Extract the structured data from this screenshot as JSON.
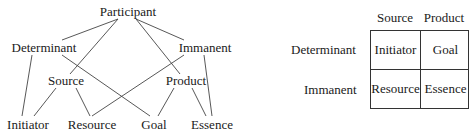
{
  "lattice": {
    "nodes": {
      "participant": "Participant",
      "determinant": "Determinant",
      "immanent": "Immanent",
      "source": "Source",
      "product": "Product",
      "initiator": "Initiator",
      "resource": "Resource",
      "goal": "Goal",
      "essence": "Essence"
    },
    "edges": [
      [
        "Participant",
        "Determinant"
      ],
      [
        "Participant",
        "Immanent"
      ],
      [
        "Participant",
        "Source"
      ],
      [
        "Participant",
        "Product"
      ],
      [
        "Determinant",
        "Initiator"
      ],
      [
        "Determinant",
        "Goal"
      ],
      [
        "Immanent",
        "Resource"
      ],
      [
        "Immanent",
        "Essence"
      ],
      [
        "Source",
        "Initiator"
      ],
      [
        "Source",
        "Resource"
      ],
      [
        "Product",
        "Goal"
      ],
      [
        "Product",
        "Essence"
      ]
    ]
  },
  "matrix": {
    "columns": [
      "Source",
      "Product"
    ],
    "rows": [
      {
        "label": "Determinant",
        "cells": [
          "Initiator",
          "Goal"
        ]
      },
      {
        "label": "Immanent",
        "cells": [
          "Resource",
          "Essence"
        ]
      }
    ]
  }
}
